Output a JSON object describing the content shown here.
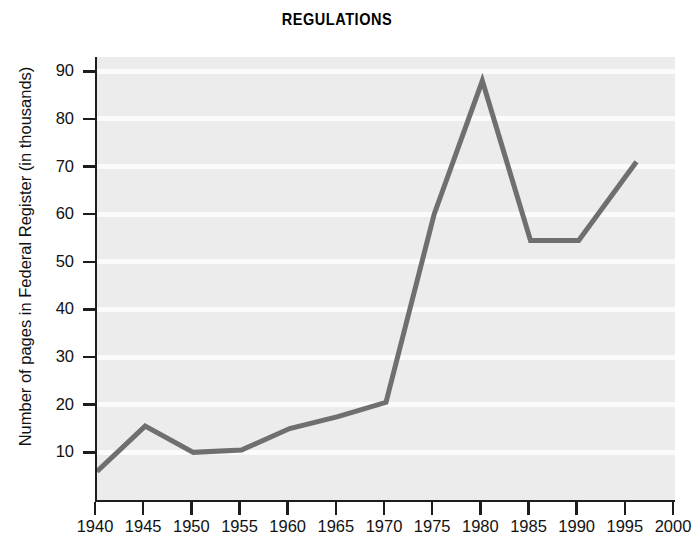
{
  "chart_data": {
    "type": "line",
    "title": "REGULATIONS",
    "xlabel": "",
    "ylabel": "Number of pages in Federal Register (in thousands)",
    "x": [
      1940,
      1945,
      1950,
      1955,
      1960,
      1965,
      1970,
      1975,
      1980,
      1985,
      1990,
      1996
    ],
    "values": [
      6,
      15.5,
      10,
      10.5,
      15,
      17.5,
      20.5,
      60,
      88,
      54.5,
      54.5,
      71
    ],
    "series": [
      {
        "name": "Pages in Federal Register",
        "values": [
          6,
          15.5,
          10,
          10.5,
          15,
          17.5,
          20.5,
          60,
          88,
          54.5,
          54.5,
          71
        ]
      }
    ],
    "xlim": [
      1940,
      2000
    ],
    "ylim": [
      0,
      93
    ],
    "xticks": [
      1940,
      1945,
      1950,
      1955,
      1960,
      1965,
      1970,
      1975,
      1980,
      1985,
      1990,
      1995,
      2000
    ],
    "xtick_labels": [
      "1940",
      "1945",
      "1950",
      "1955",
      "1960",
      "1965",
      "1970",
      "1975",
      "1980",
      "1985",
      "1990",
      "1995",
      "2000"
    ],
    "yticks": [
      10,
      20,
      30,
      40,
      50,
      60,
      70,
      80,
      90
    ],
    "ytick_labels": [
      "10",
      "20",
      "30",
      "40",
      "50",
      "60",
      "70",
      "80",
      "90"
    ],
    "grid": "horizontal",
    "legend": "none",
    "colors": {
      "line": "#6f6f6f",
      "plot_background": "#ececec",
      "gridline": "#fbfbfb",
      "axis": "#1d1d1d",
      "text": "#111111",
      "figure_background": "#ffffff"
    },
    "line_width": 5
  }
}
